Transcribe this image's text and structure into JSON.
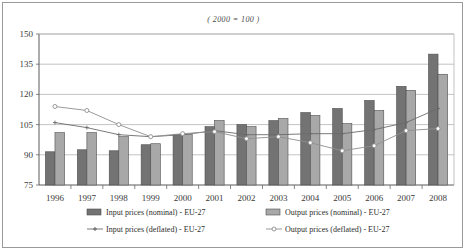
{
  "chart_data": {
    "type": "bar",
    "title": "( 2000 = 100 )",
    "xlabel": "",
    "ylabel": "",
    "categories": [
      "1996",
      "1997",
      "1998",
      "1999",
      "2000",
      "2001",
      "2002",
      "2003",
      "2004",
      "2005",
      "2006",
      "2007",
      "2008"
    ],
    "ylim": [
      75,
      150
    ],
    "yticks": [
      75,
      90,
      105,
      120,
      135,
      150
    ],
    "grid": true,
    "legend_position": "bottom",
    "series": [
      {
        "name": "Input prices (nominal) - EU-27",
        "render": "bar",
        "color": "#737373",
        "values": [
          91.5,
          92.5,
          92.0,
          95.0,
          100.0,
          104.0,
          105.0,
          107.0,
          111.0,
          113.0,
          117.0,
          124.0,
          140.0
        ]
      },
      {
        "name": "Output prices (nominal) - EU-27",
        "render": "bar",
        "color": "#a8a8a8",
        "values": [
          101.0,
          101.0,
          99.0,
          95.5,
          100.0,
          107.0,
          104.0,
          108.0,
          109.5,
          105.5,
          112.0,
          122.0,
          130.0
        ]
      },
      {
        "name": "Input prices (deflated) - EU-27",
        "render": "line",
        "color": "#6b6b6b",
        "marker": "cross",
        "values": [
          106.0,
          103.5,
          100.0,
          99.0,
          100.0,
          102.0,
          100.0,
          100.0,
          100.5,
          100.5,
          102.5,
          106.0,
          113.0
        ]
      },
      {
        "name": "Output prices (deflated) - EU-27",
        "render": "line",
        "color": "#8f8f8f",
        "marker": "circle",
        "values": [
          114.0,
          112.0,
          105.0,
          99.0,
          100.5,
          101.5,
          98.0,
          99.0,
          96.0,
          92.0,
          94.5,
          102.0,
          103.0
        ]
      }
    ]
  },
  "legend": {
    "items": [
      {
        "label": "Input prices (nominal) - EU-27",
        "type": "swatch",
        "color": "#737373"
      },
      {
        "label": "Output prices (nominal) - EU-27",
        "type": "swatch",
        "color": "#a8a8a8"
      },
      {
        "label": "Input prices (deflated) - EU-27",
        "type": "line-cross",
        "color": "#6b6b6b"
      },
      {
        "label": "Output prices (deflated) - EU-27",
        "type": "line-circle",
        "color": "#8f8f8f"
      }
    ]
  }
}
